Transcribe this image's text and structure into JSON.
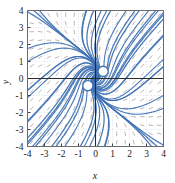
{
  "figure": {
    "background_color": "#ffffff",
    "frame_color": "#6b6b6b",
    "axis_color": "#2a2a2a",
    "grid_color": "#c9d4e4",
    "trajectory_color": "#3f72b4",
    "trajectory_color_light": "#8fb3da",
    "field_dash_color": "#9a8f86"
  },
  "axes": {
    "x_title": "x",
    "y_title": "y",
    "x_ticks": [
      "-4",
      "-3",
      "-2",
      "-1",
      "0",
      "1",
      "2",
      "3",
      "4"
    ],
    "y_ticks": [
      "4",
      "3",
      "2",
      "1",
      "0",
      "-1",
      "-2",
      "-3",
      "-4"
    ],
    "x_tick_values": [
      -4,
      -3,
      -2,
      -1,
      0,
      1,
      2,
      3,
      4
    ],
    "y_tick_values": [
      4,
      3,
      2,
      1,
      0,
      -1,
      -2,
      -3,
      -4
    ]
  },
  "chart_data": {
    "type": "line",
    "title": "",
    "xlabel": "x",
    "ylabel": "y",
    "xlim": [
      -4,
      4
    ],
    "ylim": [
      -4,
      4
    ],
    "grid": true,
    "legend": "none",
    "x": [
      -4,
      -3,
      -2,
      -1,
      0,
      1,
      2,
      3,
      4
    ],
    "values": [
      -4,
      -3,
      -2,
      -1,
      0,
      1,
      2,
      3,
      4
    ],
    "series": [
      {
        "name": "spiral-trajectories-q1",
        "kind": "spiral",
        "center": [
          0.45,
          0.45
        ],
        "direction": "counterclockwise",
        "count": 11,
        "start_radii": [
          0.28,
          0.5,
          0.75,
          1.05,
          1.4,
          1.8,
          2.2,
          2.65,
          3.1,
          3.6,
          4.1
        ]
      },
      {
        "name": "spiral-trajectories-q3",
        "kind": "spiral",
        "center": [
          -0.45,
          -0.45
        ],
        "direction": "counterclockwise",
        "count": 11,
        "start_radii": [
          0.28,
          0.5,
          0.75,
          1.05,
          1.4,
          1.8,
          2.2,
          2.65,
          3.1,
          3.6,
          4.1
        ]
      },
      {
        "name": "radial-rays-q2",
        "kind": "ray",
        "count": 11,
        "angles_deg": [
          96,
          105,
          114,
          124,
          134,
          144,
          154,
          163,
          172,
          178,
          182
        ]
      },
      {
        "name": "radial-rays-q4",
        "kind": "ray",
        "count": 11,
        "angles_deg": [
          -84,
          -75,
          -66,
          -56,
          -46,
          -36,
          -26,
          -17,
          -8,
          -2,
          2
        ]
      },
      {
        "name": "closed-loop-upper",
        "kind": "closed-loop",
        "center": [
          0.45,
          0.42
        ],
        "radius": 0.3
      },
      {
        "name": "closed-loop-lower",
        "kind": "closed-loop",
        "center": [
          -0.45,
          -0.42
        ],
        "radius": 0.3
      }
    ],
    "direction_field": {
      "kind": "dash-segments",
      "grid_step": 0.5,
      "color": "#9a8f86",
      "note": "short dashes tangent to the flow at each grid node"
    }
  }
}
